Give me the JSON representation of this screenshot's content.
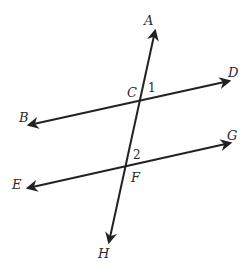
{
  "diagram": {
    "colors": {
      "line": "#222222",
      "text": "#2a2a2a",
      "background": "#ffffff"
    },
    "lines": [
      {
        "id": "transversal",
        "from": "H",
        "to": "A",
        "through": [
          "C",
          "F"
        ]
      },
      {
        "id": "line-BD",
        "from": "B",
        "to": "D",
        "through": [
          "C"
        ]
      },
      {
        "id": "line-EG",
        "from": "E",
        "to": "G",
        "through": [
          "F"
        ]
      }
    ],
    "points": {
      "A": "A",
      "B": "B",
      "C": "C",
      "D": "D",
      "E": "E",
      "F": "F",
      "G": "G",
      "H": "H"
    },
    "angles": {
      "angle1": "1",
      "angle2": "2"
    }
  }
}
